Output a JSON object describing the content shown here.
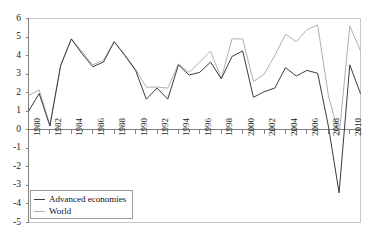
{
  "chart_data": {
    "type": "line",
    "title": "",
    "subtitle": "",
    "xlabel": "",
    "ylabel": "",
    "grid": false,
    "legend_position": "bottom-left",
    "ylim": [
      -5,
      6
    ],
    "ytick_step": 1,
    "yticks": [
      "6",
      "5",
      "4",
      "3",
      "2",
      "1",
      "0",
      "-1",
      "-2",
      "-3",
      "-4",
      "-5"
    ],
    "xlim": [
      1980,
      2011
    ],
    "xtick_step": 2,
    "xticks": [
      "1980",
      "1982",
      "1984",
      "1986",
      "1988",
      "1990",
      "1992",
      "1994",
      "1996",
      "1998",
      "2000",
      "2002",
      "2004",
      "2006",
      "2008",
      "2010"
    ],
    "x": [
      1980,
      1981,
      1982,
      1983,
      1984,
      1985,
      1986,
      1987,
      1988,
      1989,
      1990,
      1991,
      1992,
      1993,
      1994,
      1995,
      1996,
      1997,
      1998,
      1999,
      2000,
      2001,
      2002,
      2003,
      2004,
      2005,
      2006,
      2007,
      2008,
      2009,
      2010,
      2011
    ],
    "series": [
      {
        "name": "Advanced economies",
        "color": "#3c3c3c",
        "values": [
          1.0,
          1.95,
          0.2,
          3.45,
          4.9,
          4.1,
          3.4,
          3.65,
          4.75,
          4.0,
          3.2,
          1.65,
          2.25,
          1.65,
          3.5,
          2.95,
          3.1,
          3.65,
          2.75,
          3.95,
          4.25,
          1.75,
          2.05,
          2.25,
          3.35,
          2.9,
          3.2,
          3.05,
          0.2,
          -3.4,
          3.5,
          1.95
        ]
      },
      {
        "name": "World",
        "color": "#b0b0b0",
        "values": [
          1.85,
          2.15,
          0.25,
          3.5,
          4.9,
          4.2,
          3.5,
          3.75,
          4.75,
          4.05,
          3.25,
          2.3,
          2.3,
          2.25,
          3.55,
          3.1,
          3.65,
          4.25,
          2.75,
          4.9,
          4.9,
          2.6,
          3.0,
          4.0,
          5.15,
          4.75,
          5.4,
          5.65,
          1.85,
          -0.3,
          5.6,
          4.25
        ]
      }
    ]
  },
  "legend": {
    "items": [
      {
        "label": "Advanced economies",
        "color": "#3c3c3c"
      },
      {
        "label": "World",
        "color": "#b0b0b0"
      }
    ]
  },
  "axes": {
    "axis_color": "#808080",
    "tick_color": "#808080",
    "plot_border_color": "#c8c8c8"
  }
}
